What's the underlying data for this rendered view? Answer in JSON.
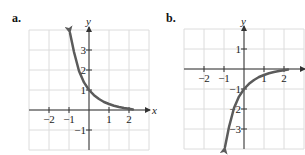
{
  "chart_data": [
    {
      "type": "line",
      "panel_label": "a.",
      "title": "",
      "xlabel": "x",
      "ylabel": "y",
      "xlim": [
        -3,
        3
      ],
      "ylim": [
        -2,
        4
      ],
      "grid": true,
      "x_ticks": [
        -2,
        -1,
        1,
        2
      ],
      "x_tick_labels": [
        "−2",
        "−1",
        "1",
        "2"
      ],
      "y_ticks": [
        -1,
        1,
        2,
        3
      ],
      "y_tick_labels": [
        "−1",
        "1",
        "2",
        "3"
      ],
      "series": [
        {
          "name": "curve-a",
          "description": "decreasing exponential through (0,1), approaching 0 as x increases",
          "x": [
            -0.95,
            -0.75,
            -0.5,
            -0.25,
            0,
            0.25,
            0.5,
            0.75,
            1,
            1.25,
            1.5,
            1.75,
            2,
            2.2
          ],
          "y": [
            3.85,
            2.9,
            1.95,
            1.38,
            1,
            0.74,
            0.55,
            0.4,
            0.3,
            0.21,
            0.15,
            0.1,
            0.06,
            0.03
          ],
          "arrow_start": true,
          "arrow_end": false
        }
      ]
    },
    {
      "type": "line",
      "panel_label": "b.",
      "title": "",
      "xlabel": "x",
      "ylabel": "y",
      "xlim": [
        -3,
        3
      ],
      "ylim": [
        -4,
        2
      ],
      "grid": true,
      "x_ticks": [
        -2,
        -1,
        1,
        2
      ],
      "x_tick_labels": [
        "−2",
        "−1",
        "1",
        "2"
      ],
      "y_ticks": [
        -3,
        -2,
        -1,
        1
      ],
      "y_tick_labels": [
        "−3",
        "−2",
        "−1",
        "1"
      ],
      "series": [
        {
          "name": "curve-b",
          "description": "reflected exponential through (0,-1), approaching 0 from below as x increases",
          "x": [
            -0.95,
            -0.75,
            -0.5,
            -0.25,
            0,
            0.25,
            0.5,
            0.75,
            1,
            1.25,
            1.5,
            1.75,
            2,
            2.2
          ],
          "y": [
            -3.9,
            -2.9,
            -1.95,
            -1.38,
            -1,
            -0.74,
            -0.55,
            -0.4,
            -0.3,
            -0.21,
            -0.15,
            -0.1,
            -0.06,
            -0.03
          ],
          "arrow_start": true,
          "arrow_end": false
        }
      ]
    }
  ],
  "layout": {
    "unit_px": 20,
    "panels": [
      {
        "origin": [
          89,
          110
        ],
        "grid_left": 30,
        "grid_top": 30,
        "grid_right": 150,
        "grid_bottom": 150,
        "label_pos": [
          12,
          22
        ],
        "xlabel_pos": [
          152,
          114
        ],
        "ylabel_pos": [
          86,
          25
        ]
      },
      {
        "origin": [
          244,
          69
        ],
        "grid_left": 184,
        "grid_top": 29,
        "grid_right": 304,
        "grid_bottom": 149,
        "label_pos": [
          166,
          22
        ],
        "xlabel_pos": [
          152,
          114
        ],
        "ylabel_pos": [
          241,
          25
        ]
      }
    ]
  },
  "colors": {
    "grid": "#dcdcdc",
    "axis": "#333333",
    "curve": "#5b5b5b",
    "text": "#222222"
  }
}
